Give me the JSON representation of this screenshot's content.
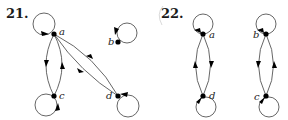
{
  "figures": [
    {
      "number_label": "21.",
      "nodes": [
        {
          "id": "a",
          "label": "a"
        },
        {
          "id": "b",
          "label": "b"
        },
        {
          "id": "c",
          "label": "c"
        },
        {
          "id": "d",
          "label": "d"
        }
      ],
      "edges": [
        {
          "from": "a",
          "to": "a",
          "type": "loop"
        },
        {
          "from": "b",
          "to": "b",
          "type": "loop"
        },
        {
          "from": "c",
          "to": "c",
          "type": "loop"
        },
        {
          "from": "d",
          "to": "d",
          "type": "loop"
        },
        {
          "from": "a",
          "to": "c"
        },
        {
          "from": "c",
          "to": "a"
        },
        {
          "from": "a",
          "to": "d"
        },
        {
          "from": "d",
          "to": "a"
        }
      ]
    },
    {
      "number_label": "22.",
      "nodes": [
        {
          "id": "a",
          "label": "a"
        },
        {
          "id": "b",
          "label": "b"
        },
        {
          "id": "c",
          "label": "c"
        },
        {
          "id": "d",
          "label": "d"
        }
      ],
      "edges": [
        {
          "from": "a",
          "to": "a",
          "type": "loop"
        },
        {
          "from": "b",
          "to": "b",
          "type": "loop"
        },
        {
          "from": "c",
          "to": "c",
          "type": "loop"
        },
        {
          "from": "d",
          "to": "d",
          "type": "loop"
        },
        {
          "from": "a",
          "to": "d"
        },
        {
          "from": "d",
          "to": "a"
        },
        {
          "from": "b",
          "to": "c"
        },
        {
          "from": "c",
          "to": "b"
        }
      ]
    }
  ],
  "colors": {
    "edge": "#555555",
    "node": "#000000",
    "background": "#ffffff"
  }
}
